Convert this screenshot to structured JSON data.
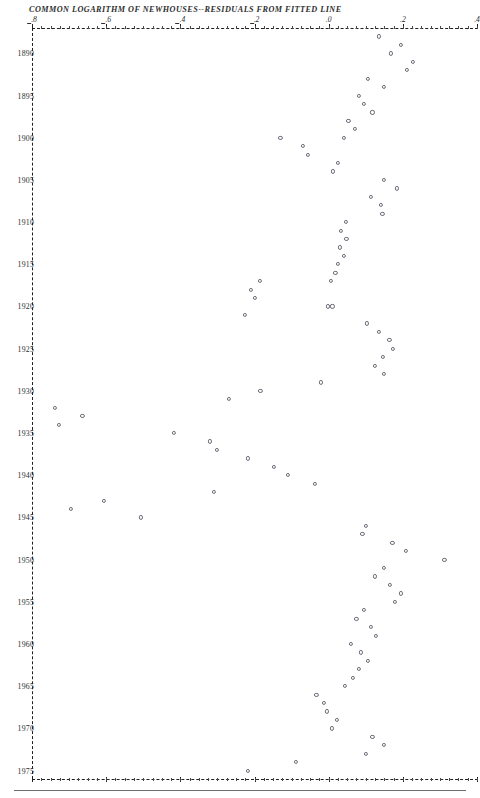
{
  "chart_data": {
    "type": "scatter",
    "title": "COMMON LOGARITHM OF NEWHOUSES--RESIDUALS FROM FITTED LINE",
    "xlabel": "",
    "ylabel": "",
    "orientation": "horizontal-value-vertical-time",
    "grid": false,
    "legend": null,
    "xlim": [
      -0.8,
      0.4
    ],
    "ylim": [
      1887,
      1976
    ],
    "xticks": [
      -0.8,
      -0.6,
      -0.4,
      -0.2,
      0.0,
      0.2,
      0.4
    ],
    "xtick_labels": [
      "-.8",
      "-.6",
      "-.4",
      "-.2",
      ".0",
      ".2",
      ".4"
    ],
    "yticks": [
      1890,
      1895,
      1900,
      1905,
      1910,
      1915,
      1920,
      1925,
      1930,
      1935,
      1940,
      1945,
      1950,
      1955,
      1960,
      1965,
      1970,
      1975
    ],
    "ytick_labels": [
      "1890",
      "1895",
      "1900",
      "1905",
      "1910",
      "1915",
      "1920",
      "1925",
      "1930",
      "1935",
      "1940",
      "1945",
      "1950",
      "1955",
      "1960",
      "1965",
      "1970",
      "1975"
    ],
    "x_minor_tick_step": 0.025,
    "series": [
      {
        "name": "residual",
        "marker": "open-circle",
        "color": "#6b6b78",
        "points": [
          {
            "year": 1888,
            "value": 0.135
          },
          {
            "year": 1889,
            "value": 0.195
          },
          {
            "year": 1890,
            "value": 0.168
          },
          {
            "year": 1891,
            "value": 0.228
          },
          {
            "year": 1892,
            "value": 0.211
          },
          {
            "year": 1893,
            "value": 0.105
          },
          {
            "year": 1894,
            "value": 0.148
          },
          {
            "year": 1895,
            "value": 0.082
          },
          {
            "year": 1896,
            "value": 0.094
          },
          {
            "year": 1897,
            "value": 0.118
          },
          {
            "year": 1898,
            "value": 0.053
          },
          {
            "year": 1899,
            "value": 0.07
          },
          {
            "year": 1900,
            "value": 0.042
          },
          {
            "year": 1900,
            "value": -0.13
          },
          {
            "year": 1901,
            "value": -0.07
          },
          {
            "year": 1902,
            "value": -0.056
          },
          {
            "year": 1903,
            "value": 0.026
          },
          {
            "year": 1904,
            "value": 0.012
          },
          {
            "year": 1905,
            "value": 0.148
          },
          {
            "year": 1906,
            "value": 0.185
          },
          {
            "year": 1907,
            "value": 0.113
          },
          {
            "year": 1908,
            "value": 0.14
          },
          {
            "year": 1909,
            "value": 0.145
          },
          {
            "year": 1910,
            "value": 0.046
          },
          {
            "year": 1911,
            "value": 0.034
          },
          {
            "year": 1912,
            "value": 0.048
          },
          {
            "year": 1913,
            "value": 0.03
          },
          {
            "year": 1914,
            "value": 0.04
          },
          {
            "year": 1915,
            "value": 0.024
          },
          {
            "year": 1916,
            "value": 0.018
          },
          {
            "year": 1917,
            "value": 0.006
          },
          {
            "year": 1917,
            "value": -0.185
          },
          {
            "year": 1918,
            "value": -0.21
          },
          {
            "year": 1919,
            "value": -0.199
          },
          {
            "year": 1920,
            "value": -0.003
          },
          {
            "year": 1920,
            "value": 0.01
          },
          {
            "year": 1921,
            "value": -0.226
          },
          {
            "year": 1922,
            "value": 0.103
          },
          {
            "year": 1923,
            "value": 0.135
          },
          {
            "year": 1924,
            "value": 0.164
          },
          {
            "year": 1925,
            "value": 0.174
          },
          {
            "year": 1926,
            "value": 0.146
          },
          {
            "year": 1927,
            "value": 0.124
          },
          {
            "year": 1928,
            "value": 0.148
          },
          {
            "year": 1929,
            "value": -0.02
          },
          {
            "year": 1930,
            "value": -0.184
          },
          {
            "year": 1931,
            "value": -0.269
          },
          {
            "year": 1932,
            "value": -0.738
          },
          {
            "year": 1933,
            "value": -0.664
          },
          {
            "year": 1934,
            "value": -0.727
          },
          {
            "year": 1935,
            "value": -0.418
          },
          {
            "year": 1936,
            "value": -0.321
          },
          {
            "year": 1937,
            "value": -0.302
          },
          {
            "year": 1938,
            "value": -0.217
          },
          {
            "year": 1939,
            "value": -0.147
          },
          {
            "year": 1940,
            "value": -0.111
          },
          {
            "year": 1941,
            "value": -0.037
          },
          {
            "year": 1942,
            "value": -0.31
          },
          {
            "year": 1943,
            "value": -0.607
          },
          {
            "year": 1944,
            "value": -0.696
          },
          {
            "year": 1945,
            "value": -0.507
          },
          {
            "year": 1946,
            "value": 0.101
          },
          {
            "year": 1947,
            "value": 0.091
          },
          {
            "year": 1948,
            "value": 0.172
          },
          {
            "year": 1949,
            "value": 0.209
          },
          {
            "year": 1950,
            "value": 0.312
          },
          {
            "year": 1951,
            "value": 0.15
          },
          {
            "year": 1952,
            "value": 0.125
          },
          {
            "year": 1953,
            "value": 0.166
          },
          {
            "year": 1954,
            "value": 0.194
          },
          {
            "year": 1955,
            "value": 0.178
          },
          {
            "year": 1956,
            "value": 0.096
          },
          {
            "year": 1957,
            "value": 0.075
          },
          {
            "year": 1958,
            "value": 0.113
          },
          {
            "year": 1959,
            "value": 0.128
          },
          {
            "year": 1960,
            "value": 0.061
          },
          {
            "year": 1961,
            "value": 0.088
          },
          {
            "year": 1962,
            "value": 0.106
          },
          {
            "year": 1963,
            "value": 0.081
          },
          {
            "year": 1964,
            "value": 0.065
          },
          {
            "year": 1965,
            "value": 0.043
          },
          {
            "year": 1966,
            "value": -0.033
          },
          {
            "year": 1967,
            "value": -0.012
          },
          {
            "year": 1968,
            "value": -0.004
          },
          {
            "year": 1969,
            "value": 0.022
          },
          {
            "year": 1970,
            "value": 0.009
          },
          {
            "year": 1971,
            "value": 0.118
          },
          {
            "year": 1972,
            "value": 0.15
          },
          {
            "year": 1973,
            "value": 0.1
          },
          {
            "year": 1974,
            "value": -0.089
          },
          {
            "year": 1975,
            "value": -0.217
          }
        ]
      }
    ]
  }
}
